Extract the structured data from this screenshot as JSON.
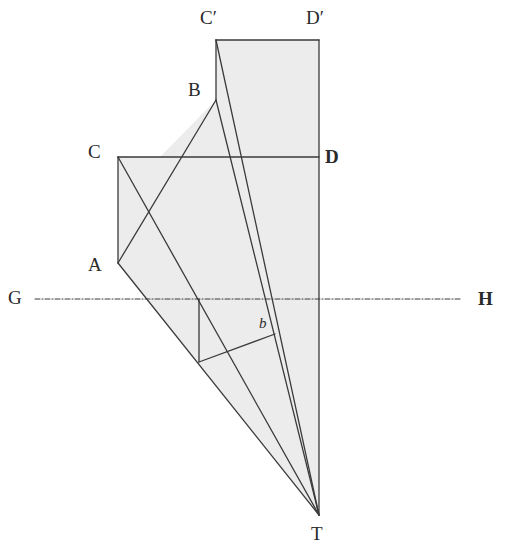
{
  "figure": {
    "type": "perspective-construction-diagram",
    "background": "#ffffff",
    "shade_color": "#ececec",
    "line_color": "#3a3a3a"
  },
  "labels": {
    "c_prime": "C′",
    "d_prime": "D′",
    "b_upper": "B",
    "c": "C",
    "d": "D",
    "a": "A",
    "g": "G",
    "h": "H",
    "b_lower": "b",
    "t": "T"
  },
  "points": {
    "C_prime": [
      216,
      40
    ],
    "D_prime": [
      319,
      40
    ],
    "B": [
      216,
      100
    ],
    "C": [
      118,
      157
    ],
    "D": [
      319,
      157
    ],
    "A": [
      118,
      263
    ],
    "G_line_start": [
      35,
      299
    ],
    "H_line_end": [
      462,
      299
    ],
    "T": [
      319,
      515
    ],
    "ground_pt": [
      199,
      299
    ],
    "foot_pt": [
      199,
      362
    ],
    "b_pt": [
      275,
      334
    ]
  }
}
